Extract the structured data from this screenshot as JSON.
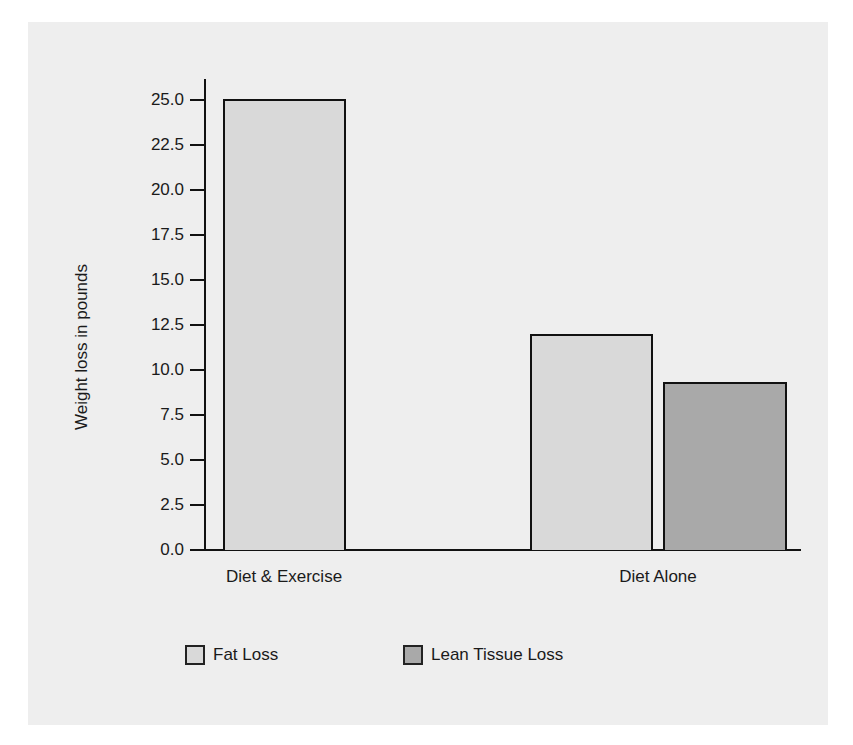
{
  "chart_data": {
    "type": "bar",
    "title": "",
    "xlabel": "",
    "ylabel": "Weight loss in pounds",
    "ylim": [
      0,
      25
    ],
    "yticks": [
      "0.0",
      "2.5",
      "5.0",
      "7.5",
      "10.0",
      "12.5",
      "15.0",
      "17.5",
      "20.0",
      "22.5",
      "25.0"
    ],
    "categories": [
      "Diet & Exercise",
      "Diet Alone"
    ],
    "series": [
      {
        "name": "Fat Loss",
        "color": "#d9d9d9",
        "values": [
          25.0,
          12.0
        ]
      },
      {
        "name": "Lean Tissue Loss",
        "color": "#a9a9a9",
        "values": [
          null,
          9.3
        ]
      }
    ],
    "grid": false,
    "legend_position": "bottom"
  },
  "legend": {
    "items": [
      {
        "label": "Fat Loss",
        "color": "#d9d9d9"
      },
      {
        "label": "Lean Tissue Loss",
        "color": "#a9a9a9"
      }
    ]
  }
}
